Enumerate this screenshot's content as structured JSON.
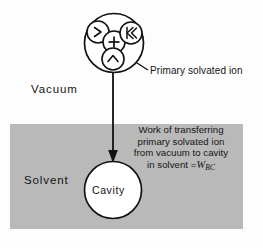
{
  "figure": {
    "type": "schematic-diagram",
    "background_color": "#fdfdfd",
    "solvent_fill_color": "#b9b9b9",
    "line_color": "#111111",
    "regions": {
      "vacuum_label": "Vacuum",
      "solvent_label": "Solvent",
      "cavity_label": "Cavity"
    },
    "callout": {
      "label": "Primary solvated ion"
    },
    "work_note": {
      "line1": "Work of transferring",
      "line2": "primary solvated ion",
      "line3": "from vacuum  to cavity",
      "line4_prefix": "in solvent =",
      "symbol": "W",
      "symbol_subscript": "BC"
    },
    "ion_cluster": {
      "glyphs": [
        {
          "name": "water-molecule-left",
          "char": ">"
        },
        {
          "name": "central-ion-charge",
          "char": "+"
        },
        {
          "name": "water-molecule-right",
          "char": "K"
        },
        {
          "name": "water-molecule-bottom",
          "char": "^"
        }
      ]
    },
    "arrow": {
      "name": "transfer-arrow",
      "direction": "down"
    }
  }
}
